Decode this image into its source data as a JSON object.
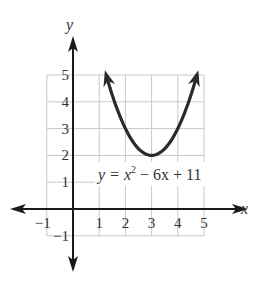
{
  "chart_data": {
    "type": "line",
    "title": "",
    "equation": "y = x² − 6x + 11",
    "equation_parts": {
      "lhs": "y = x",
      "exp": "2",
      "rhs": " − 6x + 11"
    },
    "xlabel": "x",
    "ylabel": "y",
    "xlim": [
      -1,
      5
    ],
    "ylim": [
      -1,
      5
    ],
    "grid": true,
    "x_ticks": [
      -1,
      1,
      2,
      3,
      4,
      5
    ],
    "y_ticks": [
      -1,
      1,
      2,
      3,
      4,
      5
    ],
    "x_tick_labels": [
      "−1",
      "1",
      "2",
      "3",
      "4",
      "5"
    ],
    "y_tick_labels": [
      "−1",
      "1",
      "2",
      "3",
      "4",
      "5"
    ],
    "series": [
      {
        "name": "y = x^2 - 6x + 11",
        "function": "x^2 - 6x + 11",
        "x": [
          1.2,
          1.5,
          2,
          2.5,
          3,
          3.5,
          4,
          4.5,
          4.8
        ],
        "values": [
          5.24,
          4.25,
          3,
          2.25,
          2,
          2.25,
          3,
          4.25,
          5.24
        ],
        "vertex": [
          3,
          2
        ],
        "arrows_at_ends": true
      }
    ],
    "colors": {
      "curve": "#2b2b2b",
      "grid": "#c8c8c8",
      "axes": "#1a1a1a"
    }
  }
}
